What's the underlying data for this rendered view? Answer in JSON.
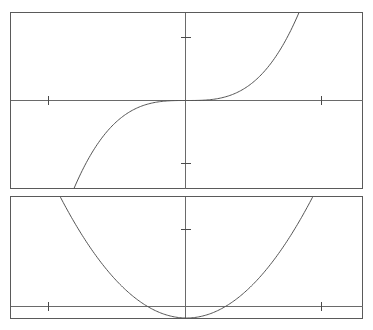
{
  "figure": {
    "title": "",
    "panel_count": 2,
    "background_color": "#ffffff",
    "line_color": "#555555",
    "frame_color": "#5a5a5a",
    "axis_color": "#6a6a6a",
    "tick_color": "#4a4a4a"
  },
  "chart_data": [
    {
      "type": "line",
      "name": "top-panel-cubic",
      "title": "",
      "xlabel": "",
      "ylabel": "",
      "grid": false,
      "legend_position": "none",
      "annotations": [],
      "tick_labels": {
        "x": [],
        "y": []
      },
      "x_ticks": [
        -1,
        1
      ],
      "y_ticks": [
        -1,
        1
      ],
      "xlim": [
        -1.75,
        1.75
      ],
      "ylim": [
        -1.4,
        1.4
      ],
      "function": "y = x^3",
      "x": [
        -1.75,
        -1.6,
        -1.4,
        -1.2,
        -1.0,
        -0.8,
        -0.6,
        -0.4,
        -0.2,
        0.0,
        0.2,
        0.4,
        0.6,
        0.8,
        1.0,
        1.2,
        1.4,
        1.6,
        1.75
      ],
      "values": [
        -5.359,
        -4.096,
        -2.744,
        -1.728,
        -1.0,
        -0.512,
        -0.216,
        -0.064,
        -0.008,
        0.0,
        0.008,
        0.064,
        0.216,
        0.512,
        1.0,
        1.728,
        2.744,
        4.096,
        5.359
      ]
    },
    {
      "type": "line",
      "name": "bottom-panel-parabola",
      "title": "",
      "xlabel": "",
      "ylabel": "",
      "grid": false,
      "legend_position": "none",
      "annotations": [],
      "tick_labels": {
        "x": [],
        "y": []
      },
      "x_ticks": [
        -1,
        1
      ],
      "y_ticks": [
        1
      ],
      "xlim": [
        -1.75,
        1.75
      ],
      "ylim": [
        0,
        1.58
      ],
      "function": "y = x^2",
      "x": [
        -1.26,
        -1.1,
        -0.95,
        -0.8,
        -0.65,
        -0.5,
        -0.35,
        -0.2,
        0.0,
        0.2,
        0.35,
        0.5,
        0.65,
        0.8,
        0.95,
        1.1,
        1.26
      ],
      "values": [
        1.588,
        1.21,
        0.903,
        0.64,
        0.423,
        0.25,
        0.123,
        0.04,
        0.0,
        0.04,
        0.123,
        0.25,
        0.423,
        0.64,
        0.903,
        1.21,
        1.588
      ]
    }
  ],
  "geometry": {
    "top_panel": {
      "frame": {
        "x": 10.5,
        "y": 12.5,
        "width": 352,
        "height": 176
      },
      "x_axis_y": 100.5,
      "y_axis_x": 185.5,
      "x_tick_positions": [
        48.5,
        321.5
      ],
      "y_tick_positions": [
        37.5,
        163.5
      ],
      "curve_path": "M 34.8,188 C 48,174 62,152 80,133 C 98,115 120,104 143,101 C 160,99.6 173,99.5 185.5,100.5 C 198,101.5 211,101.4 228,99 C 251,95.8 273,85 291,67 C 309,48 323,26 335.5,12.6"
    },
    "bottom_panel": {
      "frame": {
        "x": 10.5,
        "y": 196.5,
        "width": 352,
        "height": 121.5
      },
      "x_axis_y": 306.5,
      "y_axis_x": 185.5,
      "x_tick_positions": [
        48.5,
        321.5
      ],
      "y_tick_positions": [
        229.5
      ],
      "curve_path": "M 87,197 C 100,216 118,247 136,272 C 150,291 165,303 175,306 C 181,307.3 190,307.3 196,306 C 206,303 221,291 235,272 C 253,247 271,216 284,197"
    }
  }
}
